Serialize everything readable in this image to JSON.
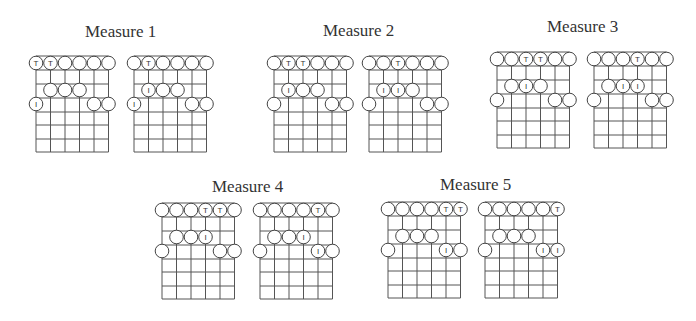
{
  "colors": {
    "background": "#ffffff",
    "line": "#555555",
    "circle_stroke": "#444444",
    "text": "#333333"
  },
  "grid": {
    "strings": 6,
    "string_spacing": 14.5,
    "row_lines": [
      0,
      14,
      28,
      42,
      56,
      69,
      83,
      96
    ],
    "circle_radius": 6.8,
    "row_centers": {
      "0": 7,
      "2": 34,
      "3": 48
    }
  },
  "measures": [
    {
      "title": "Measure 1",
      "title_x": 85,
      "title_y": 23,
      "diagrams": [
        {
          "x": 36,
          "y": 56,
          "rows": [
            {
              "row": 0,
              "marks": [
                "T",
                "T",
                "O",
                "O",
                "O",
                "O"
              ]
            },
            {
              "row": 2,
              "marks": [
                "",
                "O",
                "O",
                "O",
                "",
                ""
              ]
            },
            {
              "row": 3,
              "marks": [
                "I",
                "",
                "",
                "",
                "O",
                "O"
              ]
            }
          ]
        },
        {
          "x": 134,
          "y": 56,
          "rows": [
            {
              "row": 0,
              "marks": [
                "O",
                "T",
                "O",
                "O",
                "O",
                "O"
              ]
            },
            {
              "row": 2,
              "marks": [
                "",
                "I",
                "O",
                "O",
                "",
                ""
              ]
            },
            {
              "row": 3,
              "marks": [
                "I",
                "",
                "",
                "",
                "O",
                "O"
              ]
            }
          ]
        }
      ]
    },
    {
      "title": "Measure 2",
      "title_x": 323,
      "title_y": 22,
      "diagrams": [
        {
          "x": 274,
          "y": 56,
          "rows": [
            {
              "row": 0,
              "marks": [
                "O",
                "T",
                "T",
                "O",
                "O",
                "O"
              ]
            },
            {
              "row": 2,
              "marks": [
                "",
                "I",
                "O",
                "O",
                "",
                ""
              ]
            },
            {
              "row": 3,
              "marks": [
                "O",
                "",
                "",
                "",
                "O",
                "O"
              ]
            }
          ]
        },
        {
          "x": 369,
          "y": 56,
          "rows": [
            {
              "row": 0,
              "marks": [
                "O",
                "O",
                "T",
                "O",
                "O",
                "O"
              ]
            },
            {
              "row": 2,
              "marks": [
                "",
                "I",
                "I",
                "O",
                "",
                ""
              ]
            },
            {
              "row": 3,
              "marks": [
                "O",
                "",
                "",
                "",
                "O",
                "O"
              ]
            }
          ]
        }
      ]
    },
    {
      "title": "Measure 3",
      "title_x": 547,
      "title_y": 18,
      "diagrams": [
        {
          "x": 497,
          "y": 52,
          "rows": [
            {
              "row": 0,
              "marks": [
                "O",
                "O",
                "T",
                "T",
                "O",
                "O"
              ]
            },
            {
              "row": 2,
              "marks": [
                "",
                "O",
                "I",
                "O",
                "",
                ""
              ]
            },
            {
              "row": 3,
              "marks": [
                "O",
                "",
                "",
                "",
                "O",
                "O"
              ]
            }
          ]
        },
        {
          "x": 594,
          "y": 52,
          "rows": [
            {
              "row": 0,
              "marks": [
                "O",
                "O",
                "O",
                "T",
                "O",
                "O"
              ]
            },
            {
              "row": 2,
              "marks": [
                "",
                "O",
                "I",
                "I",
                "",
                ""
              ]
            },
            {
              "row": 3,
              "marks": [
                "O",
                "",
                "",
                "",
                "O",
                "O"
              ]
            }
          ]
        }
      ]
    },
    {
      "title": "Measure 4",
      "title_x": 212,
      "title_y": 178,
      "diagrams": [
        {
          "x": 162,
          "y": 203,
          "rows": [
            {
              "row": 0,
              "marks": [
                "O",
                "O",
                "O",
                "T",
                "T",
                "O"
              ]
            },
            {
              "row": 2,
              "marks": [
                "",
                "O",
                "O",
                "I",
                "",
                ""
              ]
            },
            {
              "row": 3,
              "marks": [
                "O",
                "",
                "",
                "",
                "O",
                "O"
              ]
            }
          ]
        },
        {
          "x": 260,
          "y": 203,
          "rows": [
            {
              "row": 0,
              "marks": [
                "O",
                "O",
                "O",
                "O",
                "T",
                "O"
              ]
            },
            {
              "row": 2,
              "marks": [
                "",
                "O",
                "O",
                "I",
                "",
                ""
              ]
            },
            {
              "row": 3,
              "marks": [
                "O",
                "",
                "",
                "",
                "I",
                "O"
              ]
            }
          ]
        }
      ]
    },
    {
      "title": "Measure 5",
      "title_x": 440,
      "title_y": 176,
      "diagrams": [
        {
          "x": 388,
          "y": 202,
          "rows": [
            {
              "row": 0,
              "marks": [
                "O",
                "O",
                "O",
                "O",
                "T",
                "T"
              ]
            },
            {
              "row": 2,
              "marks": [
                "",
                "O",
                "O",
                "O",
                "",
                ""
              ]
            },
            {
              "row": 3,
              "marks": [
                "O",
                "",
                "",
                "",
                "I",
                "O"
              ]
            }
          ]
        },
        {
          "x": 485,
          "y": 202,
          "rows": [
            {
              "row": 0,
              "marks": [
                "O",
                "O",
                "O",
                "O",
                "O",
                "T"
              ]
            },
            {
              "row": 2,
              "marks": [
                "",
                "O",
                "O",
                "O",
                "",
                ""
              ]
            },
            {
              "row": 3,
              "marks": [
                "O",
                "",
                "",
                "",
                "I",
                "I"
              ]
            }
          ]
        }
      ]
    }
  ]
}
